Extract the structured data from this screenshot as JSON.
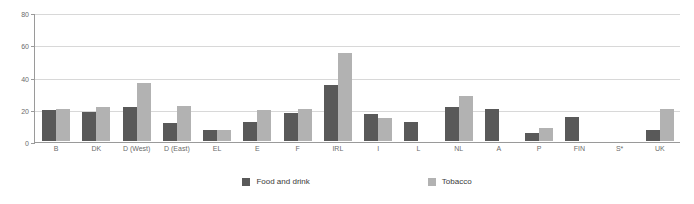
{
  "chart_data": {
    "type": "bar",
    "title": "",
    "subtitle": "",
    "xlabel": "",
    "ylabel": "",
    "ylim": [
      0,
      80
    ],
    "yticks": [
      0,
      20,
      40,
      60,
      80
    ],
    "grid": true,
    "legend_position": "bottom",
    "categories": [
      "B",
      "DK",
      "D (West)",
      "D (East)",
      "EL",
      "E",
      "F",
      "IRL",
      "I",
      "L",
      "NL",
      "A",
      "P",
      "FIN",
      "S*",
      "UK"
    ],
    "series": [
      {
        "name": "Food and drink",
        "color": "#595959",
        "values": [
          19,
          18,
          21,
          11,
          7,
          12,
          17.5,
          35,
          17,
          12,
          21,
          20,
          5,
          15,
          0,
          7
        ]
      },
      {
        "name": "Tobacco",
        "color": "#b2b2b2",
        "values": [
          20,
          21,
          36,
          22,
          7,
          19,
          20,
          54.5,
          14,
          0,
          28,
          0,
          8,
          0,
          0,
          20
        ]
      }
    ]
  },
  "axis": {
    "y_tick_labels": [
      "0",
      "20",
      "40",
      "60",
      "80"
    ]
  },
  "legend": {
    "items": [
      {
        "label": "Food and drink",
        "swatch": "food"
      },
      {
        "label": "Tobacco",
        "swatch": "tobacco"
      }
    ]
  }
}
